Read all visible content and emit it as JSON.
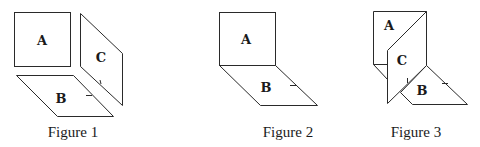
{
  "figures": [
    {
      "caption": "Figure 1",
      "panels": {
        "a": "A",
        "b": "B",
        "c": "C"
      }
    },
    {
      "caption": "Figure 2",
      "panels": {
        "a": "A",
        "b": "B"
      }
    },
    {
      "caption": "Figure 3",
      "panels": {
        "a": "A",
        "b": "B",
        "c": "C"
      }
    }
  ],
  "colors": {
    "stroke": "#2a2a2a",
    "fill": "#ffffff",
    "text": "#1a1a1a"
  }
}
